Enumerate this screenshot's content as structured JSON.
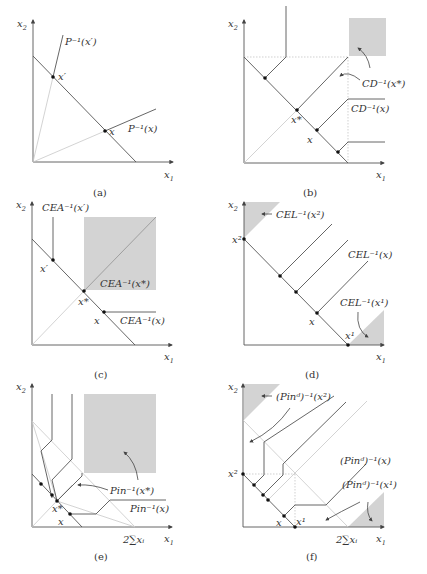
{
  "figure": {
    "panels": [
      {
        "id": "a",
        "caption": "(a)",
        "axis_x": "x",
        "axis_x_sub": "1",
        "axis_y": "x",
        "axis_y_sub": "2",
        "labels": {
          "p_inv_xprime": "P⁻¹(x′)",
          "xprime": "x′",
          "x": "x",
          "p_inv_x": "P⁻¹(x)"
        }
      },
      {
        "id": "b",
        "caption": "(b)",
        "axis_x": "x",
        "axis_x_sub": "1",
        "axis_y": "x",
        "axis_y_sub": "2",
        "labels": {
          "cd_inv_xstar": "CD⁻¹(x*)",
          "cd_inv_x": "CD⁻¹(x)",
          "xstar": "x*",
          "x": "x"
        }
      },
      {
        "id": "c",
        "caption": "(c)",
        "axis_x": "x",
        "axis_x_sub": "1",
        "axis_y": "x",
        "axis_y_sub": "2",
        "labels": {
          "cea_inv_xprime": "CEA⁻¹(x′)",
          "xprime": "x′",
          "cea_inv_xstar": "CEA⁻¹(x*)",
          "xstar": "x*",
          "x": "x",
          "cea_inv_x": "CEA⁻¹(x)"
        }
      },
      {
        "id": "d",
        "caption": "(d)",
        "axis_x": "x",
        "axis_x_sub": "1",
        "axis_y": "x",
        "axis_y_sub": "2",
        "labels": {
          "cel_inv_x2": "CEL⁻¹(x²)",
          "x2": "x²",
          "cel_inv_x": "CEL⁻¹(x)",
          "cel_inv_x1": "CEL⁻¹(x¹)",
          "x": "x",
          "x1": "x¹"
        }
      },
      {
        "id": "e",
        "caption": "(e)",
        "axis_x": "x",
        "axis_x_sub": "1",
        "axis_y": "x",
        "axis_y_sub": "2",
        "labels": {
          "pin_inv_xstar": "Pin⁻¹(x*)",
          "pin_inv_x": "Pin⁻¹(x)",
          "xstar": "x*",
          "x": "x",
          "sum_tick": "2∑xᵢ"
        }
      },
      {
        "id": "f",
        "caption": "(f)",
        "axis_x": "x",
        "axis_x_sub": "1",
        "axis_y": "x",
        "axis_y_sub": "2",
        "labels": {
          "pind_inv_x2": "(Pinᵈ)⁻¹(x²)",
          "pind_inv_x": "(Pinᵈ)⁻¹(x)",
          "pind_inv_x1": "(Pinᵈ)⁻¹(x¹)",
          "x2": "x²",
          "x": "x",
          "x1": "x¹",
          "sum_tick": "2∑xᵢ"
        }
      }
    ]
  }
}
